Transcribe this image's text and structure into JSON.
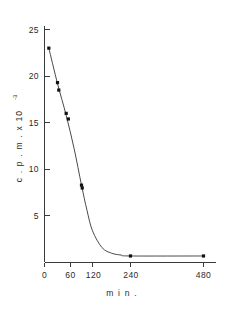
{
  "chart_data": {
    "type": "line",
    "title": "",
    "subtitle": "",
    "xlabel": "m i n .",
    "ylabel": "c . p . m .  x  10",
    "ylabel_exponent": "-3",
    "x_tick_labels": [
      "0",
      "60",
      "120",
      "240",
      "480"
    ],
    "x_tick_values": [
      0,
      60,
      120,
      240,
      480
    ],
    "y_tick_labels": [
      "5",
      "10",
      "15",
      "20",
      "25"
    ],
    "y_tick_values": [
      5,
      10,
      15,
      20,
      25
    ],
    "ylim": [
      0,
      26
    ],
    "xlim": [
      0,
      520
    ],
    "grid": false,
    "legend": null,
    "axis_scale_note": "x axis compressed after 120",
    "series": [
      {
        "name": "c.p.m. decay",
        "marker": "filled-square",
        "line_style": "solid",
        "color": "#4a4a4a",
        "points": [
          {
            "x": 10,
            "y": 23.0
          },
          {
            "x": 30,
            "y": 19.3
          },
          {
            "x": 33,
            "y": 18.5
          },
          {
            "x": 50,
            "y": 16.0
          },
          {
            "x": 55,
            "y": 15.4
          },
          {
            "x": 90,
            "y": 8.3
          },
          {
            "x": 92,
            "y": 8.0
          },
          {
            "x": 240,
            "y": 0.7
          },
          {
            "x": 480,
            "y": 0.7
          }
        ]
      }
    ],
    "fitted_curve": [
      {
        "x": 10,
        "y": 23.0
      },
      {
        "x": 30,
        "y": 19.2
      },
      {
        "x": 50,
        "y": 15.8
      },
      {
        "x": 70,
        "y": 12.2
      },
      {
        "x": 90,
        "y": 8.3
      },
      {
        "x": 105,
        "y": 5.6
      },
      {
        "x": 120,
        "y": 3.4
      },
      {
        "x": 150,
        "y": 1.6
      },
      {
        "x": 180,
        "y": 1.0
      },
      {
        "x": 210,
        "y": 0.8
      },
      {
        "x": 240,
        "y": 0.7
      },
      {
        "x": 480,
        "y": 0.7
      }
    ]
  },
  "colors": {
    "axis": "#3a3a3a",
    "curve": "#4a4a4a",
    "marker": "#111111",
    "background": "#ffffff"
  }
}
